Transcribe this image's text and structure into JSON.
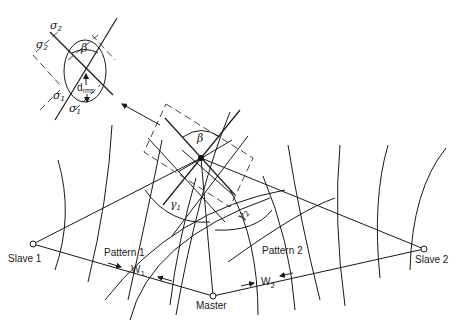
{
  "diagram": {
    "stations": {
      "slave1": {
        "label": "Slave 1",
        "x": 33,
        "y": 244
      },
      "master": {
        "label": "Master",
        "x": 213,
        "y": 296
      },
      "slave2": {
        "label": "Slave 2",
        "x": 424,
        "y": 249
      }
    },
    "fix_point": {
      "x": 201,
      "y": 158
    },
    "labels": {
      "pattern1": "Pattern 1",
      "pattern2": "Pattern 2",
      "w1_main": "W",
      "w1_sub": "1",
      "w2_main": "W",
      "w2_sub": "2",
      "beta_main": "β",
      "gamma1_main": "γ",
      "gamma1_sub": "1",
      "gamma2_main": "γ",
      "gamma2_sub": "2"
    },
    "inset": {
      "sigma2_outer": "σ",
      "sigma2_outer_sub": "2",
      "sigma2_inner": "σ",
      "sigma2_inner_sub": "2",
      "sigma1_inner": "σ",
      "sigma1_inner_sub": "1",
      "sigma1_outer": "σ",
      "sigma1_outer_sub": "1",
      "beta": "β",
      "drms_main": "d",
      "drms_sub": "rms"
    },
    "colors": {
      "line": "#1a1a1a",
      "background": "#ffffff"
    }
  }
}
